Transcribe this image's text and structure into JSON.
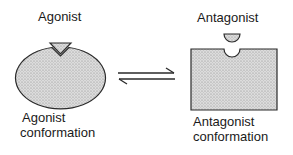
{
  "diagram": {
    "left": {
      "ligand_label": "Agonist",
      "state_label_line1": "Agonist",
      "state_label_line2": "conformation",
      "ligand_shape": "triangle",
      "receptor_shape": "ellipse-with-v-notch"
    },
    "right": {
      "ligand_label": "Antagonist",
      "state_label_line1": "Antagonist",
      "state_label_line2": "conformation",
      "ligand_shape": "half-circle",
      "receptor_shape": "rectangle-with-round-notch"
    },
    "equilibrium_icon": "equilibrium-harpoons",
    "colors": {
      "fill": "#d4d4d4",
      "stroke": "#2a2a2a"
    }
  }
}
